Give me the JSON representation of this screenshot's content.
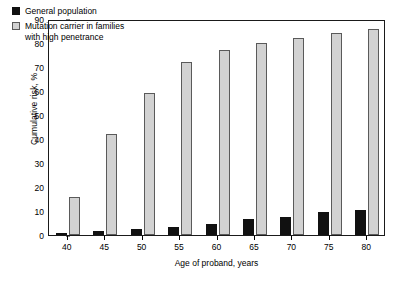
{
  "chart_data": {
    "type": "bar",
    "title": "",
    "xlabel": "Age of proband, years",
    "ylabel": "Cumulative risk, %",
    "categories": [
      "40",
      "45",
      "50",
      "55",
      "60",
      "65",
      "70",
      "75",
      "80"
    ],
    "series": [
      {
        "name": "General population",
        "color": "#111111",
        "values": [
          1,
          1.5,
          2.5,
          3.5,
          4.5,
          6.5,
          7.5,
          9.5,
          10.5
        ]
      },
      {
        "name": "Mutation carrier in families\nwith high penetrance",
        "color": "#d2d2d2",
        "values": [
          16,
          42,
          59,
          72,
          77,
          80,
          82,
          84,
          86
        ]
      }
    ],
    "ylim": [
      0,
      90
    ],
    "yticks": [
      0,
      10,
      20,
      30,
      40,
      50,
      60,
      70,
      80,
      90
    ],
    "grid": false,
    "legend_position": "top-left"
  }
}
